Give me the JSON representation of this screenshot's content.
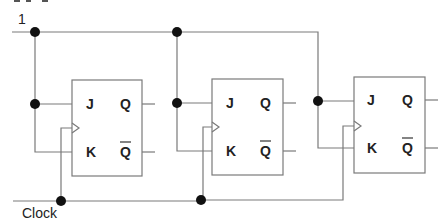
{
  "diagram": {
    "type": "circuit",
    "title_fragment": "",
    "input_label": "1",
    "clock_label": "Clock",
    "flip_flops": [
      {
        "name": "FF1",
        "j": "J",
        "k": "K",
        "q": "Q",
        "qbar": "Q"
      },
      {
        "name": "FF2",
        "j": "J",
        "k": "K",
        "q": "Q",
        "qbar": "Q"
      },
      {
        "name": "FF3",
        "j": "J",
        "k": "K",
        "q": "Q",
        "qbar": "Q"
      }
    ],
    "colors": {
      "wire": "#7a7a7a",
      "junction": "#111111",
      "text": "#222222"
    }
  }
}
